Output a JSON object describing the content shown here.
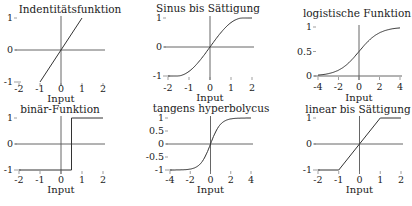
{
  "figure": {
    "width": 412,
    "height": 206
  },
  "chart_data": [
    {
      "type": "line",
      "title": "Indentitätsfunktion",
      "xlabel": "Input",
      "ylabel": "",
      "function": "identity",
      "xlim": [
        -2,
        2
      ],
      "ylim": [
        -1,
        1
      ],
      "xticks": [
        -2,
        -1,
        0,
        1,
        2
      ],
      "yticks": [
        -1,
        0,
        1
      ],
      "x": [
        -1,
        0,
        1
      ],
      "y": [
        -1,
        0,
        1
      ],
      "grid": false,
      "box": {
        "x0": 19,
        "x1": 103,
        "yTop": 18,
        "yBot": 82,
        "ticklabel_y": 92,
        "xlabel_y": 102,
        "title_x": 70,
        "title_y": 13
      }
    },
    {
      "type": "line",
      "title": "Sinus bis Sättigung",
      "xlabel": "Input",
      "ylabel": "",
      "function": "sine_saturation",
      "xlim": [
        -2,
        2
      ],
      "ylim": [
        -1,
        1
      ],
      "xticks": [
        -2,
        -1,
        0,
        1,
        2
      ],
      "yticks": [
        -1,
        0,
        1
      ],
      "x": [
        -2,
        -1.57,
        -1,
        -0.5,
        0,
        0.5,
        1,
        1.57,
        2
      ],
      "y": [
        -1,
        -1,
        -0.84,
        -0.48,
        0,
        0.48,
        0.84,
        1,
        1
      ],
      "grid": false,
      "box": {
        "x0": 168,
        "x1": 252,
        "yTop": 18,
        "yBot": 76,
        "ticklabel_y": 91,
        "xlabel_y": 101,
        "title_x": 208,
        "title_y": 12
      }
    },
    {
      "type": "line",
      "title": "logistische Funktion",
      "xlabel": "Input",
      "ylabel": "",
      "function": "logistic",
      "xlim": [
        -4,
        4
      ],
      "ylim": [
        0,
        1
      ],
      "xticks": [
        -4,
        -2,
        0,
        2,
        4
      ],
      "yticks": [
        0,
        0.5,
        1
      ],
      "x": [
        -4,
        -3,
        -2,
        -1,
        0,
        1,
        2,
        3,
        4
      ],
      "y": [
        0.018,
        0.047,
        0.119,
        0.269,
        0.5,
        0.731,
        0.881,
        0.953,
        0.982
      ],
      "grid": false,
      "box": {
        "x0": 318,
        "x1": 400,
        "yTop": 27,
        "yBot": 76,
        "ticklabel_y": 90,
        "xlabel_y": 101,
        "title_x": 357,
        "title_y": 17
      }
    },
    {
      "type": "line",
      "title": "binär-Funktion",
      "xlabel": "Input",
      "ylabel": "",
      "function": "binary_step",
      "xlim": [
        -2,
        2
      ],
      "ylim": [
        -1,
        1
      ],
      "xticks": [
        -2,
        -1,
        0,
        1,
        2
      ],
      "yticks": [
        -1,
        0,
        1
      ],
      "x": [
        -2,
        0.5,
        0.5,
        2
      ],
      "y": [
        -1,
        -1,
        1,
        1
      ],
      "grid": false,
      "box": {
        "x0": 19,
        "x1": 103,
        "yTop": 118,
        "yBot": 170,
        "ticklabel_y": 183,
        "xlabel_y": 193,
        "title_x": 60,
        "title_y": 113
      }
    },
    {
      "type": "line",
      "title": "tangens hyperbolycus",
      "xlabel": "Input",
      "ylabel": "",
      "function": "tanh",
      "xlim": [
        -4,
        4
      ],
      "ylim": [
        -1,
        1
      ],
      "xticks": [
        -4,
        -2,
        0,
        2,
        4
      ],
      "yticks": [
        -1,
        -0.5,
        0,
        0.5,
        1
      ],
      "x": [
        -4,
        -3,
        -2,
        -1,
        -0.5,
        0,
        0.5,
        1,
        2,
        3,
        4
      ],
      "y": [
        -0.999,
        -0.995,
        -0.964,
        -0.762,
        -0.462,
        0,
        0.462,
        0.762,
        0.964,
        0.995,
        0.999
      ],
      "grid": false,
      "box": {
        "x0": 170,
        "x1": 251,
        "yTop": 118,
        "yBot": 170,
        "ticklabel_y": 183,
        "xlabel_y": 193,
        "title_x": 211,
        "title_y": 112
      }
    },
    {
      "type": "line",
      "title": "linear bis Sättigung",
      "xlabel": "Input",
      "ylabel": "",
      "function": "linear_saturation",
      "xlim": [
        -2,
        2
      ],
      "ylim": [
        -1,
        1
      ],
      "xticks": [
        -2,
        -1,
        0,
        1,
        2
      ],
      "yticks": [
        -1,
        0,
        1
      ],
      "x": [
        -2,
        -1,
        1,
        2
      ],
      "y": [
        -1,
        -1,
        1,
        1
      ],
      "grid": false,
      "box": {
        "x0": 318,
        "x1": 401,
        "yTop": 118,
        "yBot": 170,
        "ticklabel_y": 183,
        "xlabel_y": 193,
        "title_x": 358,
        "title_y": 113
      }
    }
  ]
}
